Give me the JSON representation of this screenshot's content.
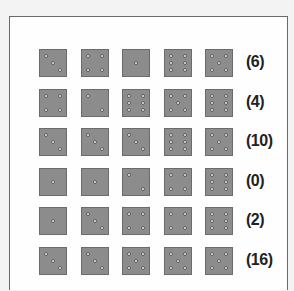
{
  "puzzle": {
    "rows": [
      {
        "dice": [
          3,
          4,
          1,
          6,
          5
        ],
        "score": "(6)"
      },
      {
        "dice": [
          4,
          2,
          6,
          5,
          6
        ],
        "score": "(4)"
      },
      {
        "dice": [
          3,
          3,
          3,
          6,
          5
        ],
        "score": "(10)"
      },
      {
        "dice": [
          1,
          1,
          2,
          4,
          6
        ],
        "score": "(0)"
      },
      {
        "dice": [
          1,
          3,
          4,
          4,
          6
        ],
        "score": "(2)"
      },
      {
        "dice": [
          3,
          3,
          5,
          5,
          5
        ],
        "score": "(16)"
      }
    ]
  },
  "colors": {
    "die_face": "#8c8c8c",
    "pip": "#f4f4f4",
    "frame_border": "#6a6a6a",
    "score_text": "#222222"
  }
}
